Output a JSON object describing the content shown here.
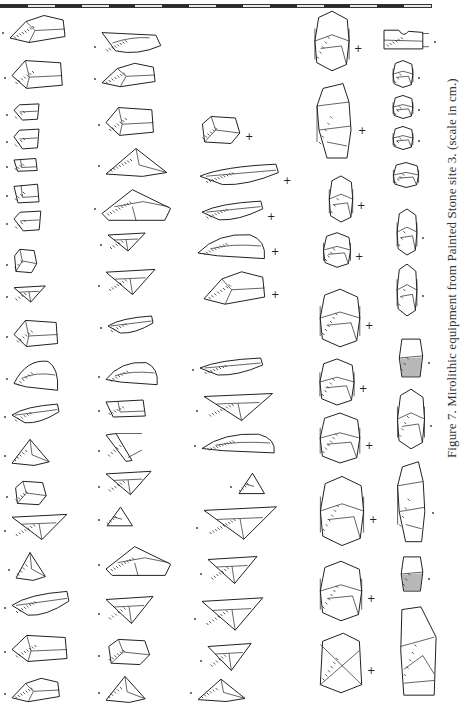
{
  "figure": {
    "caption": "Figure 7. Mirolithic equipment from Painted Stone site 3. (scale in cm.)",
    "scale_bar": {
      "segments": 16,
      "unit": "cm"
    }
  },
  "colors": {
    "ink": "#222222",
    "paper": "#ffffff",
    "caption": "#333333"
  },
  "columns": [
    {
      "id": "col-1",
      "items": [
        {
          "x": 8,
          "y": 14,
          "w": 60,
          "h": 30,
          "shape": "flake-a",
          "orient": "dot-left"
        },
        {
          "x": 10,
          "y": 58,
          "w": 55,
          "h": 32,
          "shape": "trapeze",
          "orient": "dot-left"
        },
        {
          "x": 12,
          "y": 103,
          "w": 30,
          "h": 18,
          "shape": "small-trap",
          "orient": "dot-left"
        },
        {
          "x": 12,
          "y": 128,
          "w": 30,
          "h": 22,
          "shape": "small-trap",
          "orient": "dot-left"
        },
        {
          "x": 12,
          "y": 157,
          "w": 28,
          "h": 15,
          "shape": "small-rect",
          "orient": "dot-left"
        },
        {
          "x": 12,
          "y": 182,
          "w": 30,
          "h": 22,
          "shape": "small-rect",
          "orient": "dot-left"
        },
        {
          "x": 12,
          "y": 210,
          "w": 32,
          "h": 22,
          "shape": "small-trap",
          "orient": "dot-left"
        },
        {
          "x": 12,
          "y": 248,
          "w": 26,
          "h": 26,
          "shape": "block",
          "orient": "dot-left"
        },
        {
          "x": 12,
          "y": 285,
          "w": 34,
          "h": 18,
          "shape": "triangle-down",
          "orient": "dot-left"
        },
        {
          "x": 12,
          "y": 318,
          "w": 48,
          "h": 30,
          "shape": "trapeze",
          "orient": "dot-left"
        },
        {
          "x": 12,
          "y": 358,
          "w": 48,
          "h": 34,
          "shape": "crescent",
          "orient": "dot-left"
        },
        {
          "x": 10,
          "y": 403,
          "w": 50,
          "h": 22,
          "shape": "blade",
          "orient": "dot-left"
        },
        {
          "x": 10,
          "y": 438,
          "w": 40,
          "h": 28,
          "shape": "triangle",
          "orient": "dot-left"
        },
        {
          "x": 12,
          "y": 480,
          "w": 36,
          "h": 26,
          "shape": "block",
          "orient": "dot-left"
        },
        {
          "x": 10,
          "y": 513,
          "w": 58,
          "h": 28,
          "shape": "triangle-down",
          "orient": "dot-left"
        },
        {
          "x": 14,
          "y": 551,
          "w": 32,
          "h": 30,
          "shape": "triangle",
          "orient": "dot-left"
        },
        {
          "x": 10,
          "y": 590,
          "w": 60,
          "h": 28,
          "shape": "blade",
          "orient": "dot-left"
        },
        {
          "x": 10,
          "y": 633,
          "w": 60,
          "h": 30,
          "shape": "trapeze",
          "orient": "dot-left"
        },
        {
          "x": 10,
          "y": 677,
          "w": 52,
          "h": 26,
          "shape": "flake-a",
          "orient": "dot-left"
        }
      ]
    },
    {
      "id": "col-2",
      "items": [
        {
          "x": 100,
          "y": 30,
          "w": 62,
          "h": 26,
          "shape": "crescent-down",
          "orient": "dot-left"
        },
        {
          "x": 100,
          "y": 62,
          "w": 58,
          "h": 26,
          "shape": "flake-a",
          "orient": "dot-left"
        },
        {
          "x": 104,
          "y": 105,
          "w": 52,
          "h": 32,
          "shape": "trapeze",
          "orient": "dot-left"
        },
        {
          "x": 104,
          "y": 147,
          "w": 64,
          "h": 30,
          "shape": "triangle",
          "orient": "dot-left"
        },
        {
          "x": 100,
          "y": 188,
          "w": 72,
          "h": 34,
          "shape": "trapeze-long",
          "orient": "dot-left"
        },
        {
          "x": 106,
          "y": 232,
          "w": 40,
          "h": 20,
          "shape": "triangle-down",
          "orient": "dot-left"
        },
        {
          "x": 104,
          "y": 268,
          "w": 52,
          "h": 28,
          "shape": "triangle-down",
          "orient": "dot-left"
        },
        {
          "x": 106,
          "y": 315,
          "w": 48,
          "h": 20,
          "shape": "blade",
          "orient": "dot-left"
        },
        {
          "x": 104,
          "y": 360,
          "w": 56,
          "h": 26,
          "shape": "crescent",
          "orient": "dot-left"
        },
        {
          "x": 104,
          "y": 398,
          "w": 46,
          "h": 20,
          "shape": "small-rect",
          "orient": "dot-left"
        },
        {
          "x": 104,
          "y": 432,
          "w": 40,
          "h": 30,
          "shape": "needle",
          "orient": "dot-left"
        },
        {
          "x": 104,
          "y": 470,
          "w": 48,
          "h": 26,
          "shape": "triangle-down",
          "orient": "dot-left"
        },
        {
          "x": 104,
          "y": 506,
          "w": 30,
          "h": 22,
          "shape": "tri-small",
          "orient": "dot-left"
        },
        {
          "x": 104,
          "y": 545,
          "w": 68,
          "h": 32,
          "shape": "trapeze-long",
          "orient": "dot-left"
        },
        {
          "x": 104,
          "y": 595,
          "w": 50,
          "h": 30,
          "shape": "triangle-down",
          "orient": "dot-left"
        },
        {
          "x": 104,
          "y": 638,
          "w": 48,
          "h": 28,
          "shape": "block",
          "orient": "dot-left"
        },
        {
          "x": 104,
          "y": 675,
          "w": 42,
          "h": 28,
          "shape": "triangle",
          "orient": "dot-left"
        }
      ]
    },
    {
      "id": "col-3",
      "items": [
        {
          "x": 198,
          "y": 115,
          "w": 44,
          "h": 30,
          "shape": "block",
          "orient": "plus-right"
        },
        {
          "x": 198,
          "y": 163,
          "w": 82,
          "h": 24,
          "shape": "blade",
          "orient": "plus-right"
        },
        {
          "x": 200,
          "y": 200,
          "w": 64,
          "h": 22,
          "shape": "blade",
          "orient": "plus-right"
        },
        {
          "x": 196,
          "y": 232,
          "w": 72,
          "h": 28,
          "shape": "crescent",
          "orient": "plus-right"
        },
        {
          "x": 202,
          "y": 270,
          "w": 66,
          "h": 36,
          "shape": "flake-a",
          "orient": "plus-right"
        },
        {
          "x": 198,
          "y": 357,
          "w": 66,
          "h": 20,
          "shape": "blade",
          "orient": "dot-left"
        },
        {
          "x": 202,
          "y": 392,
          "w": 72,
          "h": 30,
          "shape": "triangle-down",
          "orient": "dot-left"
        },
        {
          "x": 200,
          "y": 432,
          "w": 78,
          "h": 22,
          "shape": "crescent",
          "orient": "dot-left"
        },
        {
          "x": 236,
          "y": 472,
          "w": 30,
          "h": 24,
          "shape": "tri-small",
          "orient": "dot-left"
        },
        {
          "x": 202,
          "y": 505,
          "w": 76,
          "h": 36,
          "shape": "triangle-down",
          "orient": "dot-left"
        },
        {
          "x": 206,
          "y": 555,
          "w": 52,
          "h": 30,
          "shape": "triangle-down",
          "orient": "dot-left"
        },
        {
          "x": 200,
          "y": 596,
          "w": 64,
          "h": 36,
          "shape": "triangle-down",
          "orient": "dot-left"
        },
        {
          "x": 206,
          "y": 642,
          "w": 46,
          "h": 30,
          "shape": "triangle-down",
          "orient": "dot-left"
        },
        {
          "x": 196,
          "y": 678,
          "w": 50,
          "h": 24,
          "shape": "triangle",
          "orient": "dot-left"
        }
      ]
    },
    {
      "id": "col-4",
      "items": [
        {
          "x": 313,
          "y": 10,
          "w": 38,
          "h": 62,
          "shape": "core",
          "orient": "plus-right"
        },
        {
          "x": 315,
          "y": 82,
          "w": 40,
          "h": 80,
          "shape": "core-long",
          "orient": "plus-right"
        },
        {
          "x": 328,
          "y": 175,
          "w": 26,
          "h": 48,
          "shape": "core",
          "orient": "plus-right"
        },
        {
          "x": 322,
          "y": 232,
          "w": 30,
          "h": 36,
          "shape": "core",
          "orient": "plus-right"
        },
        {
          "x": 318,
          "y": 288,
          "w": 44,
          "h": 60,
          "shape": "core",
          "orient": "plus-right"
        },
        {
          "x": 318,
          "y": 358,
          "w": 38,
          "h": 48,
          "shape": "core",
          "orient": "plus-right"
        },
        {
          "x": 318,
          "y": 412,
          "w": 44,
          "h": 52,
          "shape": "core",
          "orient": "plus-right"
        },
        {
          "x": 318,
          "y": 475,
          "w": 48,
          "h": 72,
          "shape": "core",
          "orient": "plus-right"
        },
        {
          "x": 318,
          "y": 560,
          "w": 46,
          "h": 62,
          "shape": "core",
          "orient": "plus-right"
        },
        {
          "x": 318,
          "y": 632,
          "w": 46,
          "h": 62,
          "shape": "core-x",
          "orient": "plus-right"
        }
      ]
    },
    {
      "id": "col-5",
      "items": [
        {
          "x": 382,
          "y": 28,
          "w": 48,
          "h": 22,
          "shape": "notched",
          "orient": "dot-right"
        },
        {
          "x": 392,
          "y": 60,
          "w": 22,
          "h": 28,
          "shape": "core",
          "orient": "dot-right"
        },
        {
          "x": 392,
          "y": 95,
          "w": 22,
          "h": 24,
          "shape": "core",
          "orient": "dot-right"
        },
        {
          "x": 392,
          "y": 126,
          "w": 22,
          "h": 24,
          "shape": "core",
          "orient": "dot-right"
        },
        {
          "x": 392,
          "y": 162,
          "w": 28,
          "h": 26,
          "shape": "core",
          "orient": "none"
        },
        {
          "x": 396,
          "y": 208,
          "w": 22,
          "h": 48,
          "shape": "core",
          "orient": "dot-right"
        },
        {
          "x": 396,
          "y": 263,
          "w": 22,
          "h": 54,
          "shape": "core",
          "orient": "dot-right"
        },
        {
          "x": 398,
          "y": 337,
          "w": 26,
          "h": 42,
          "shape": "core-dark",
          "orient": "dot-right"
        },
        {
          "x": 396,
          "y": 388,
          "w": 30,
          "h": 62,
          "shape": "core",
          "orient": "dot-right"
        },
        {
          "x": 396,
          "y": 460,
          "w": 32,
          "h": 86,
          "shape": "core-long",
          "orient": "dot-right"
        },
        {
          "x": 400,
          "y": 555,
          "w": 24,
          "h": 38,
          "shape": "core-dark",
          "orient": "dot-right"
        },
        {
          "x": 400,
          "y": 605,
          "w": 38,
          "h": 92,
          "shape": "core-big",
          "orient": "none"
        }
      ]
    }
  ]
}
